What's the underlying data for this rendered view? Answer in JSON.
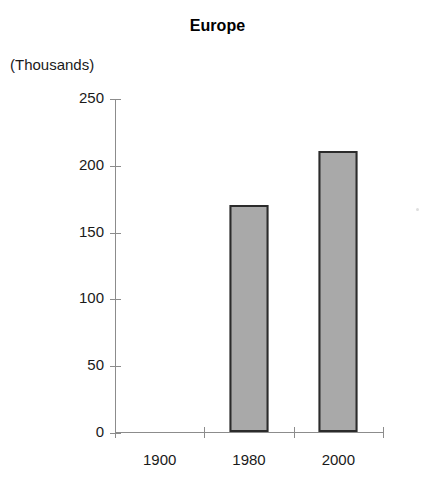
{
  "chart_data": {
    "type": "bar",
    "title": "Europe",
    "xlabel": "",
    "ylabel": "(Thousands)",
    "categories": [
      "1900",
      "1980",
      "2000"
    ],
    "values": [
      0,
      170,
      210
    ],
    "series": [
      {
        "name": "Europe",
        "values": [
          0,
          170,
          210
        ]
      }
    ],
    "ylim": [
      0,
      250
    ],
    "y_ticks": [
      0,
      50,
      100,
      150,
      200,
      250
    ],
    "y_tick_labels": [
      "0",
      "50",
      "100",
      "150",
      "200",
      "250"
    ],
    "grid": false,
    "legend": false,
    "legend_position": "none",
    "colors": {
      "bar_fill": "#a9a9a9",
      "bar_border": "#2b2b2b",
      "axis": "#8c8c8c",
      "text": "#1a1a1a",
      "background": "#ffffff"
    }
  },
  "labels": {
    "title": "Europe",
    "units": "(Thousands)"
  }
}
